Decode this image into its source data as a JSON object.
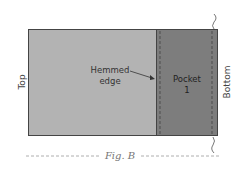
{
  "figure": {
    "labels": {
      "left": "Top",
      "right": "Bottom",
      "pointer_line1": "Hemmed",
      "pointer_line2": "edge",
      "pocket_line1": "Pocket",
      "pocket_line2": "1"
    },
    "caption": "Fig. B",
    "colors": {
      "fabric": "#b3b3b3",
      "pocket": "#7d7d7d",
      "outline": "#444444",
      "stitch": "#555555",
      "caption": "#7a7a7a"
    }
  }
}
